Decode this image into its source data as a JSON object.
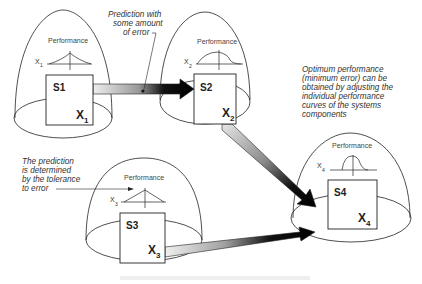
{
  "diagram": {
    "type": "system-components-performance",
    "systems": [
      {
        "id": "S1",
        "title": "S1",
        "var": "X",
        "sub": "1",
        "perf_label": "Performance",
        "axis_var": "X",
        "axis_sub": "1"
      },
      {
        "id": "S2",
        "title": "S2",
        "var": "X",
        "sub": "2",
        "perf_label": "Performance",
        "axis_var": "X",
        "axis_sub": "2"
      },
      {
        "id": "S3",
        "title": "S3",
        "var": "X",
        "sub": "3",
        "perf_label": "Performance",
        "axis_var": "X",
        "axis_sub": "3"
      },
      {
        "id": "S4",
        "title": "S4",
        "var": "X",
        "sub": "4",
        "perf_label": "Performance",
        "axis_var": "X",
        "axis_sub": "4"
      }
    ],
    "edges": [
      {
        "from": "S1",
        "to": "S2"
      },
      {
        "from": "S2",
        "to": "S4"
      },
      {
        "from": "S3",
        "to": "S4"
      }
    ],
    "annotations": {
      "prediction_error": [
        "Prediction with",
        "some amount",
        "of error"
      ],
      "tolerance": [
        "The prediction",
        "is determined",
        "by the tolerance",
        "to error"
      ],
      "optimum": [
        "Optimum performance",
        "(minimum error) can be",
        "obtained by adjusting the",
        "individual performance",
        "curves of the systems",
        "components"
      ]
    },
    "caption": "",
    "colors": {
      "stroke": "#222222",
      "arrow_dark": "#111111",
      "arrow_light": "#e6e6e6",
      "background": "#ffffff"
    }
  }
}
